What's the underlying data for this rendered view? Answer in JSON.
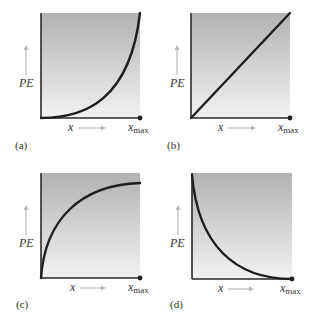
{
  "figure": {
    "panels": [
      {
        "id": "a",
        "label": "(a)",
        "curve": "increasing-convex",
        "description": "PE rises slowly then steeply toward x_max",
        "box": {
          "x": 41,
          "y": 13,
          "w": 99,
          "h": 105
        },
        "path": "M41,118 C85,118 130,100 140,13",
        "pe_arrow": {
          "x": 26,
          "y1": 75,
          "y2": 45
        },
        "pe_label": {
          "x": 19,
          "y": 87
        },
        "x_label": {
          "x": 68,
          "y": 131
        },
        "x_arrow": {
          "x1": 78,
          "x2": 106,
          "y": 128
        },
        "xmax_label": {
          "x": 128,
          "y": 131
        },
        "panel_label": {
          "x": 15,
          "y": 149
        }
      },
      {
        "id": "b",
        "label": "(b)",
        "curve": "linear",
        "description": "PE increases linearly with x",
        "box": {
          "x": 191,
          "y": 13,
          "w": 99,
          "h": 105
        },
        "path": "M191,118 L290,13",
        "pe_arrow": {
          "x": 177,
          "y1": 75,
          "y2": 45
        },
        "pe_label": {
          "x": 170,
          "y": 87
        },
        "x_label": {
          "x": 218,
          "y": 131
        },
        "x_arrow": {
          "x1": 228,
          "x2": 256,
          "y": 128
        },
        "xmax_label": {
          "x": 278,
          "y": 131
        },
        "panel_label": {
          "x": 167,
          "y": 149
        }
      },
      {
        "id": "c",
        "label": "(c)",
        "curve": "increasing-concave",
        "description": "PE rises steeply then levels off",
        "box": {
          "x": 41,
          "y": 173,
          "w": 99,
          "h": 105
        },
        "path": "M41,278 C45,220 80,185 140,183",
        "pe_arrow": {
          "x": 26,
          "y1": 235,
          "y2": 205
        },
        "pe_label": {
          "x": 19,
          "y": 247
        },
        "x_label": {
          "x": 70,
          "y": 291
        },
        "x_arrow": {
          "x1": 80,
          "x2": 106,
          "y": 288
        },
        "xmax_label": {
          "x": 128,
          "y": 291
        },
        "panel_label": {
          "x": 16,
          "y": 308
        }
      },
      {
        "id": "d",
        "label": "(d)",
        "curve": "decreasing-convex",
        "description": "PE falls steeply then levels toward zero",
        "box": {
          "x": 192,
          "y": 173,
          "w": 100,
          "h": 106
        },
        "path": "M192,175 C198,245 235,279 292,279",
        "pe_arrow": {
          "x": 178,
          "y1": 235,
          "y2": 205
        },
        "pe_label": {
          "x": 170,
          "y": 247
        },
        "x_label": {
          "x": 218,
          "y": 292
        },
        "x_arrow": {
          "x1": 228,
          "x2": 254,
          "y": 289
        },
        "xmax_label": {
          "x": 280,
          "y": 292
        },
        "panel_label": {
          "x": 170,
          "y": 308
        }
      }
    ],
    "text": {
      "y_axis": "PE",
      "x_axis": "x",
      "xmax_main": "x",
      "xmax_sub": "max"
    },
    "colors": {
      "gradient_top": "#b2b2b2",
      "gradient_bottom": "#f2f2f2",
      "curve": "#1e1e1e",
      "axis": "#2a2a2a",
      "arrow": "#b8b8b8",
      "text": "#333333"
    }
  }
}
